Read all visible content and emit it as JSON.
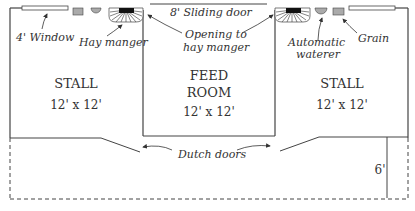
{
  "diagram": {
    "type": "barn-floor-plan",
    "colors": {
      "line": "#444444",
      "fixture_fill": "#aaaaaa",
      "manger_fill": "#111111",
      "text": "#333333"
    },
    "rooms": [
      {
        "name": "STALL",
        "size": "12' x 12'",
        "position": "left"
      },
      {
        "name_line1": "FEED",
        "name_line2": "ROOM",
        "size": "12' x 12'",
        "position": "center"
      },
      {
        "name": "STALL",
        "size": "12' x 12'",
        "position": "right"
      }
    ],
    "labels": {
      "window": "4' Window",
      "hay_manger": "Hay manger",
      "sliding_door": "8' Sliding door",
      "opening_line1": "Opening to",
      "opening_line2": "hay manger",
      "waterer_line1": "Automatic",
      "waterer_line2": "waterer",
      "grain": "Grain",
      "dutch_doors": "Dutch doors",
      "overhang": "6'"
    }
  }
}
